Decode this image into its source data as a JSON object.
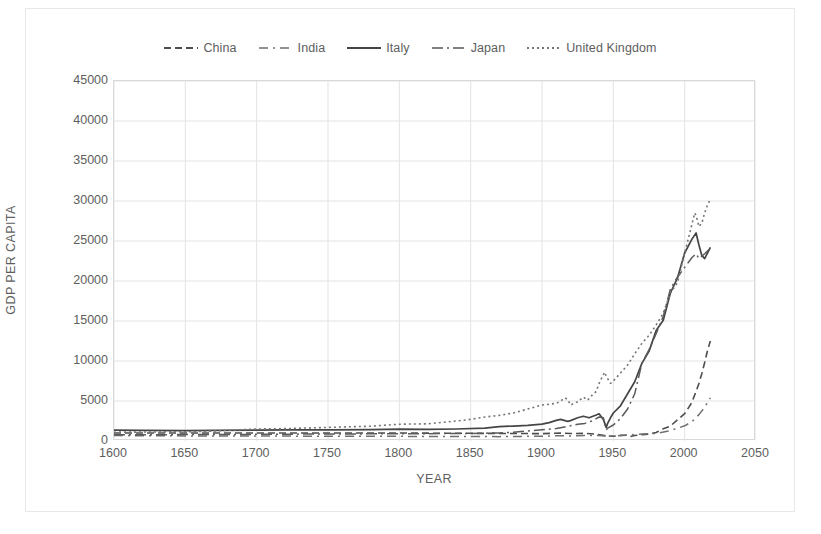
{
  "chart_data": {
    "type": "line",
    "title": "",
    "xlabel": "YEAR",
    "ylabel": "GDP PER CAPITA",
    "xlim": [
      1600,
      2050
    ],
    "ylim": [
      0,
      45000
    ],
    "grid": true,
    "legend_position": "top-center",
    "xticks": [
      1600,
      1650,
      1700,
      1750,
      1800,
      1850,
      1900,
      1950,
      2000,
      2050
    ],
    "yticks": [
      0,
      5000,
      10000,
      15000,
      20000,
      25000,
      30000,
      35000,
      40000,
      45000
    ],
    "xtick_labels": [
      "1600",
      "1650",
      "1700",
      "1750",
      "1800",
      "1850",
      "1900",
      "1950",
      "2000",
      "2050"
    ],
    "ytick_labels": [
      "0",
      "5000",
      "10000",
      "15000",
      "20000",
      "25000",
      "30000",
      "35000",
      "40000",
      "45000"
    ],
    "series": [
      {
        "name": "China",
        "dash": "7,4",
        "color": "#4d4d4d",
        "width": 1.6,
        "points": [
          [
            1600,
            1000
          ],
          [
            1650,
            1000
          ],
          [
            1700,
            1000
          ],
          [
            1750,
            1000
          ],
          [
            1800,
            1000
          ],
          [
            1820,
            980
          ],
          [
            1850,
            960
          ],
          [
            1870,
            945
          ],
          [
            1890,
            930
          ],
          [
            1900,
            920
          ],
          [
            1913,
            985
          ],
          [
            1920,
            930
          ],
          [
            1930,
            950
          ],
          [
            1938,
            860
          ],
          [
            1945,
            640
          ],
          [
            1950,
            600
          ],
          [
            1955,
            700
          ],
          [
            1960,
            720
          ],
          [
            1962,
            560
          ],
          [
            1965,
            680
          ],
          [
            1970,
            780
          ],
          [
            1975,
            870
          ],
          [
            1980,
            1060
          ],
          [
            1985,
            1520
          ],
          [
            1990,
            1870
          ],
          [
            1995,
            2650
          ],
          [
            2000,
            3420
          ],
          [
            2005,
            4800
          ],
          [
            2008,
            6200
          ],
          [
            2010,
            7200
          ],
          [
            2012,
            8400
          ],
          [
            2014,
            9800
          ],
          [
            2016,
            11300
          ],
          [
            2018,
            12500
          ]
        ]
      },
      {
        "name": "India",
        "dash": "9,5,2,5",
        "color": "#707070",
        "width": 1.5,
        "points": [
          [
            1600,
            680
          ],
          [
            1650,
            640
          ],
          [
            1700,
            620
          ],
          [
            1750,
            600
          ],
          [
            1800,
            580
          ],
          [
            1850,
            560
          ],
          [
            1870,
            545
          ],
          [
            1890,
            580
          ],
          [
            1900,
            600
          ],
          [
            1913,
            670
          ],
          [
            1920,
            635
          ],
          [
            1930,
            700
          ],
          [
            1940,
            680
          ],
          [
            1946,
            620
          ],
          [
            1950,
            620
          ],
          [
            1960,
            750
          ],
          [
            1970,
            860
          ],
          [
            1980,
            940
          ],
          [
            1990,
            1300
          ],
          [
            2000,
            1900
          ],
          [
            2005,
            2400
          ],
          [
            2010,
            3300
          ],
          [
            2014,
            4200
          ],
          [
            2018,
            5400
          ]
        ]
      },
      {
        "name": "Italy",
        "dash": "",
        "color": "#454545",
        "width": 1.7,
        "points": [
          [
            1600,
            1350
          ],
          [
            1620,
            1320
          ],
          [
            1650,
            1300
          ],
          [
            1670,
            1330
          ],
          [
            1700,
            1350
          ],
          [
            1720,
            1380
          ],
          [
            1750,
            1400
          ],
          [
            1780,
            1420
          ],
          [
            1800,
            1480
          ],
          [
            1820,
            1450
          ],
          [
            1840,
            1500
          ],
          [
            1860,
            1600
          ],
          [
            1870,
            1800
          ],
          [
            1880,
            1870
          ],
          [
            1890,
            1960
          ],
          [
            1900,
            2100
          ],
          [
            1905,
            2300
          ],
          [
            1910,
            2580
          ],
          [
            1913,
            2700
          ],
          [
            1918,
            2450
          ],
          [
            1920,
            2550
          ],
          [
            1925,
            2900
          ],
          [
            1929,
            3100
          ],
          [
            1933,
            2900
          ],
          [
            1938,
            3250
          ],
          [
            1940,
            3400
          ],
          [
            1943,
            2700
          ],
          [
            1945,
            1700
          ],
          [
            1946,
            2200
          ],
          [
            1948,
            2900
          ],
          [
            1950,
            3500
          ],
          [
            1955,
            4400
          ],
          [
            1960,
            5900
          ],
          [
            1965,
            7400
          ],
          [
            1970,
            9700
          ],
          [
            1975,
            11200
          ],
          [
            1980,
            13800
          ],
          [
            1985,
            15100
          ],
          [
            1990,
            18500
          ],
          [
            1995,
            20400
          ],
          [
            2000,
            23500
          ],
          [
            2005,
            25200
          ],
          [
            2008,
            26000
          ],
          [
            2010,
            24500
          ],
          [
            2012,
            23200
          ],
          [
            2014,
            22800
          ],
          [
            2016,
            23500
          ],
          [
            2018,
            24200
          ]
        ]
      },
      {
        "name": "Japan",
        "dash": "11,4,2,4",
        "color": "#5a5a5a",
        "width": 1.5,
        "points": [
          [
            1600,
            780
          ],
          [
            1650,
            800
          ],
          [
            1700,
            830
          ],
          [
            1750,
            880
          ],
          [
            1800,
            900
          ],
          [
            1850,
            950
          ],
          [
            1870,
            1010
          ],
          [
            1880,
            1100
          ],
          [
            1890,
            1250
          ],
          [
            1900,
            1400
          ],
          [
            1910,
            1550
          ],
          [
            1913,
            1650
          ],
          [
            1920,
            1900
          ],
          [
            1925,
            2100
          ],
          [
            1930,
            2200
          ],
          [
            1935,
            2500
          ],
          [
            1940,
            3000
          ],
          [
            1943,
            2900
          ],
          [
            1945,
            1400
          ],
          [
            1946,
            1600
          ],
          [
            1950,
            2000
          ],
          [
            1955,
            2800
          ],
          [
            1960,
            4000
          ],
          [
            1965,
            5900
          ],
          [
            1970,
            9700
          ],
          [
            1975,
            11400
          ],
          [
            1980,
            13400
          ],
          [
            1985,
            15600
          ],
          [
            1990,
            19000
          ],
          [
            1995,
            20500
          ],
          [
            2000,
            21700
          ],
          [
            2005,
            22900
          ],
          [
            2008,
            23400
          ],
          [
            2010,
            22800
          ],
          [
            2014,
            23400
          ],
          [
            2018,
            24100
          ]
        ]
      },
      {
        "name": "United Kingdom",
        "dash": "2,3",
        "color": "#757575",
        "width": 1.6,
        "points": [
          [
            1600,
            1100
          ],
          [
            1620,
            1120
          ],
          [
            1650,
            1150
          ],
          [
            1670,
            1250
          ],
          [
            1700,
            1500
          ],
          [
            1720,
            1550
          ],
          [
            1750,
            1700
          ],
          [
            1780,
            1850
          ],
          [
            1800,
            2100
          ],
          [
            1820,
            2150
          ],
          [
            1840,
            2500
          ],
          [
            1850,
            2700
          ],
          [
            1860,
            3000
          ],
          [
            1870,
            3200
          ],
          [
            1880,
            3500
          ],
          [
            1890,
            4000
          ],
          [
            1900,
            4500
          ],
          [
            1905,
            4600
          ],
          [
            1910,
            4700
          ],
          [
            1913,
            5000
          ],
          [
            1916,
            5400
          ],
          [
            1918,
            5200
          ],
          [
            1920,
            4500
          ],
          [
            1925,
            4900
          ],
          [
            1929,
            5500
          ],
          [
            1932,
            5100
          ],
          [
            1935,
            5700
          ],
          [
            1938,
            6200
          ],
          [
            1940,
            7200
          ],
          [
            1943,
            8300
          ],
          [
            1944,
            8600
          ],
          [
            1945,
            8100
          ],
          [
            1948,
            7200
          ],
          [
            1950,
            7500
          ],
          [
            1955,
            8500
          ],
          [
            1960,
            9500
          ],
          [
            1965,
            10900
          ],
          [
            1970,
            12200
          ],
          [
            1975,
            13200
          ],
          [
            1980,
            14500
          ],
          [
            1985,
            16000
          ],
          [
            1990,
            18500
          ],
          [
            1995,
            19800
          ],
          [
            2000,
            23500
          ],
          [
            2005,
            27000
          ],
          [
            2007,
            28500
          ],
          [
            2008,
            28200
          ],
          [
            2010,
            26800
          ],
          [
            2012,
            27200
          ],
          [
            2014,
            28500
          ],
          [
            2016,
            29500
          ],
          [
            2018,
            30200
          ]
        ]
      }
    ]
  },
  "legend": {
    "items": [
      {
        "label": "China"
      },
      {
        "label": "India"
      },
      {
        "label": "Italy"
      },
      {
        "label": "Japan"
      },
      {
        "label": "United Kingdom"
      }
    ]
  }
}
